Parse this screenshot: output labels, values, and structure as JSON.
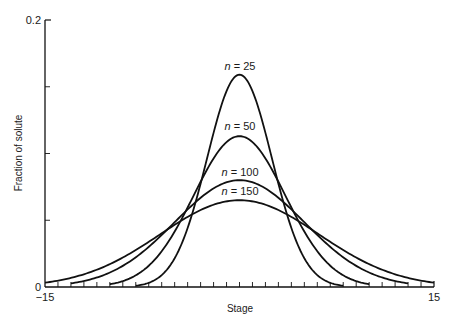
{
  "chart_data": {
    "type": "line",
    "title": "",
    "xlabel": "Stage",
    "ylabel": "Fraction of solute",
    "xlim": [
      -15,
      15
    ],
    "ylim": [
      0,
      0.2
    ],
    "x_tick_labels": [
      "-15",
      "15"
    ],
    "y_tick_labels": [
      "0",
      "0.2"
    ],
    "x_minor_tick_step": 1,
    "y_minor_ticks": [
      0.05,
      0.1,
      0.15
    ],
    "grid": false,
    "legend": "inline labels above each peak",
    "series": [
      {
        "name": "n = 25",
        "n": 25,
        "peak_x": 0,
        "peak_y": 0.159,
        "x_range": [
          -8,
          8
        ]
      },
      {
        "name": "n = 50",
        "n": 50,
        "peak_x": 0,
        "peak_y": 0.113,
        "x_range": [
          -10,
          10
        ]
      },
      {
        "name": "n = 100",
        "n": 100,
        "peak_x": 0,
        "peak_y": 0.08,
        "x_range": [
          -13,
          13
        ]
      },
      {
        "name": "n = 150",
        "n": 150,
        "peak_x": 0,
        "peak_y": 0.065,
        "x_range": [
          -15,
          15
        ]
      }
    ]
  },
  "labels": {
    "xlabel": "Stage",
    "ylabel": "Fraction of solute",
    "x_min": "−15",
    "x_max": "15",
    "y_min": "0",
    "y_max": "0.2",
    "n_prefix": "n",
    "curves": [
      {
        "value": " = 25"
      },
      {
        "value": " = 50"
      },
      {
        "value": " = 100"
      },
      {
        "value": " = 150"
      }
    ]
  },
  "colors": {
    "line": "#111111",
    "background": "#ffffff"
  }
}
